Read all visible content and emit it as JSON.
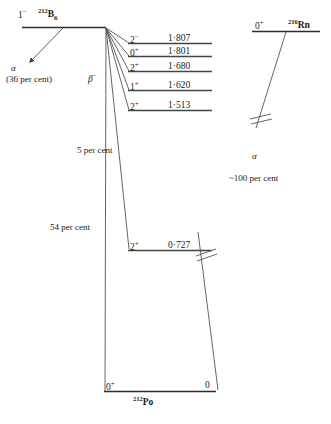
{
  "diagram": {
    "colors": {
      "level_line": "#3b4a3f",
      "transition_line": "#55554e",
      "text": "#1a1a1a"
    },
    "parent": {
      "spin": "1",
      "spin_superscript": "−",
      "mass": "212",
      "element": "B",
      "element_sub": "6"
    },
    "alpha_branch": {
      "particle": "α",
      "percent": "(36 per cent)"
    },
    "beta_branch": {
      "label": "β",
      "label_superscript": "−"
    },
    "levels": [
      {
        "spin": "2",
        "spin_superscript": "−",
        "energy": "1·807"
      },
      {
        "spin": "0",
        "spin_superscript": "+",
        "energy": "1·801"
      },
      {
        "spin": "2",
        "spin_superscript": "+",
        "energy": "1·680"
      },
      {
        "spin": "1",
        "spin_superscript": "+",
        "energy": "1·620"
      },
      {
        "spin": "2",
        "spin_superscript": "+",
        "energy": "1·513"
      },
      {
        "spin": "2",
        "spin_superscript": "+",
        "energy": "0·727"
      }
    ],
    "feed_labels": [
      {
        "text": "5 per cent"
      },
      {
        "text": "54 per cent"
      }
    ],
    "ground_state": {
      "spin_left": "0",
      "spin_left_superscript": "+",
      "spin_right": "0",
      "mass": "212",
      "element": "Po"
    },
    "daughter": {
      "spin": "0",
      "spin_superscript": "+",
      "mass": "216",
      "element": "Rn",
      "particle": "α",
      "percent": "~100 per cent"
    }
  }
}
